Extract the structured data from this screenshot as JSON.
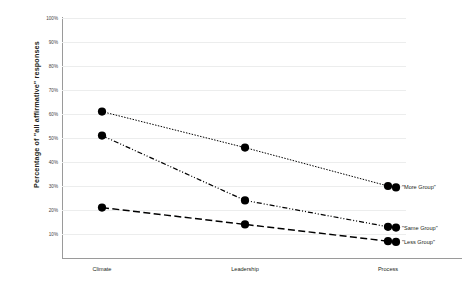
{
  "chart_data": {
    "type": "line",
    "title": "",
    "xlabel": "",
    "ylabel": "Percentage of \"all affirmative\" responses",
    "categories": [
      "Climate",
      "Leadership",
      "Process"
    ],
    "ylim": [
      0,
      100
    ],
    "yticks": [
      10,
      20,
      30,
      40,
      50,
      60,
      70,
      80,
      90,
      100
    ],
    "ytick_labels": [
      "10%",
      "20%",
      "30%",
      "40%",
      "50%",
      "60%",
      "70%",
      "80%",
      "90%",
      "100%"
    ],
    "grid": true,
    "legend_position": "right-of-line-ends",
    "series": [
      {
        "name": "\"More Group\"",
        "values": [
          61,
          46,
          30
        ],
        "line_style": "dotted",
        "marker": "circle",
        "color": "#000000"
      },
      {
        "name": "\"Same Group\"",
        "values": [
          51,
          24,
          13
        ],
        "line_style": "dash-dot-dot",
        "marker": "circle",
        "color": "#000000"
      },
      {
        "name": "\"Less Group\"",
        "values": [
          21,
          14,
          7
        ],
        "line_style": "dashed",
        "marker": "circle",
        "color": "#000000"
      }
    ]
  },
  "colors": {
    "axis": "#9a9a9a",
    "grid": "#eceded",
    "text": "#231f20",
    "series": "#000000",
    "background": "#ffffff"
  }
}
